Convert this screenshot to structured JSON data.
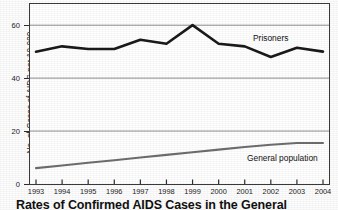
{
  "figure": {
    "caption": "Rates of Confirmed AIDS Cases in the General Population"
  },
  "chart_data": {
    "type": "line",
    "title": "",
    "xlabel": "",
    "ylabel": "No. of Cases of AIDS per 10,000",
    "x": [
      1993,
      1994,
      1995,
      1996,
      1997,
      1998,
      1999,
      2000,
      2001,
      2002,
      2003,
      2004
    ],
    "xtick_labels": [
      "1993",
      "1994",
      "1995",
      "1996",
      "1997",
      "1998",
      "1999",
      "2000",
      "2001",
      "2002",
      "2003",
      "2004"
    ],
    "ylim": [
      0,
      68
    ],
    "ytick_values": [
      0,
      20,
      40,
      60
    ],
    "ytick_labels": [
      "0",
      "20",
      "40",
      "60"
    ],
    "grid": "horizontal-at-20-40-60",
    "legend": "inline-labels",
    "series": [
      {
        "name": "Prisoners",
        "label": "Prisoners",
        "color": "#1a1a1a",
        "width": 2.6,
        "values": [
          50,
          52,
          51,
          51,
          54.5,
          53,
          60,
          53,
          52,
          48,
          51.5,
          50
        ]
      },
      {
        "name": "General population",
        "label": "General population",
        "color": "#6e6e6e",
        "width": 2.1,
        "values": [
          6,
          7,
          8,
          9,
          10,
          11,
          12,
          13,
          14,
          14.8,
          15.5,
          15.5
        ]
      }
    ]
  }
}
